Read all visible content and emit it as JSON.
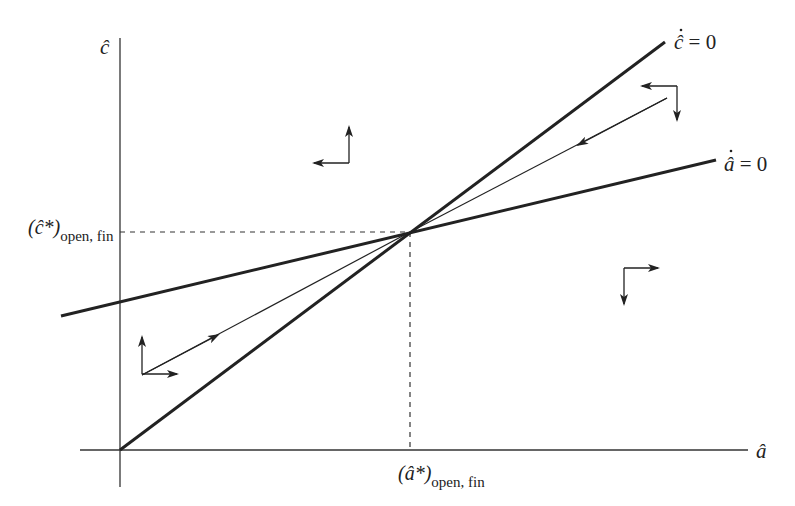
{
  "diagram": {
    "type": "phase-diagram",
    "axes": {
      "x_label": "â",
      "y_label": "ĉ"
    },
    "loci": [
      {
        "name": "c-dot-zero",
        "label_var": "ĉ",
        "label_rest": " = 0"
      },
      {
        "name": "a-dot-zero",
        "label_var": "â",
        "label_rest": " = 0"
      }
    ],
    "steady_state": {
      "c_label_main": "(ĉ*)",
      "c_label_sub": "open, fin",
      "a_label_main": "(â*)",
      "a_label_sub": "open, fin"
    },
    "saddle_path": "stable arm converging to steady state",
    "direction_arrows": [
      {
        "region": "upper-left",
        "horizontal": "left",
        "vertical": "up"
      },
      {
        "region": "upper-right",
        "horizontal": "left",
        "vertical": "down"
      },
      {
        "region": "lower-right",
        "horizontal": "right",
        "vertical": "down"
      },
      {
        "region": "lower-left",
        "horizontal": "right",
        "vertical": "up"
      }
    ],
    "colors": {
      "ink": "#222222",
      "background": "#ffffff"
    }
  }
}
